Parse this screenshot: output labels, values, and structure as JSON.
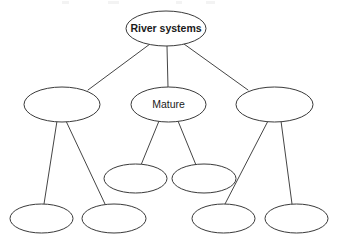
{
  "diagram": {
    "type": "concept-map-tree",
    "canvas": {
      "width": 337,
      "height": 247,
      "background": "#ffffff"
    },
    "style": {
      "node_fill": "#ffffff",
      "node_stroke": "#3a3a3a",
      "node_stroke_width": 1,
      "connector_stroke": "#454545",
      "connector_stroke_width": 1,
      "text_color": "#1a1a1a"
    },
    "nodes": [
      {
        "id": "root",
        "label": "River systems",
        "label_visible": true,
        "bold": true,
        "level": 0,
        "cx": 166,
        "cy": 28.5,
        "rx": 40,
        "ry": 17.5
      },
      {
        "id": "branch-left",
        "label": "",
        "label_visible": false,
        "bold": false,
        "level": 1,
        "cx": 62,
        "cy": 104.5,
        "rx": 38,
        "ry": 17.5
      },
      {
        "id": "branch-middle",
        "label": "Mature",
        "label_visible": true,
        "bold": false,
        "level": 1,
        "cx": 168.5,
        "cy": 104.5,
        "rx": 37.5,
        "ry": 17.5
      },
      {
        "id": "branch-right",
        "label": "",
        "label_visible": false,
        "bold": false,
        "level": 1,
        "cx": 274.5,
        "cy": 104.5,
        "rx": 38.5,
        "ry": 17.5
      },
      {
        "id": "leaf-mid-1",
        "label": "",
        "label_visible": false,
        "bold": false,
        "level": 2,
        "cx": 135.5,
        "cy": 178.5,
        "rx": 31.5,
        "ry": 14.5
      },
      {
        "id": "leaf-mid-2",
        "label": "",
        "label_visible": false,
        "bold": false,
        "level": 2,
        "cx": 204,
        "cy": 178.5,
        "rx": 32,
        "ry": 14.5
      },
      {
        "id": "leaf-bottom-1",
        "label": "",
        "label_visible": false,
        "bold": false,
        "level": 2,
        "cx": 41.5,
        "cy": 218.5,
        "rx": 31.5,
        "ry": 14.5
      },
      {
        "id": "leaf-bottom-2",
        "label": "",
        "label_visible": false,
        "bold": false,
        "level": 2,
        "cx": 114,
        "cy": 218.5,
        "rx": 32,
        "ry": 14.5
      },
      {
        "id": "leaf-bottom-3",
        "label": "",
        "label_visible": false,
        "bold": false,
        "level": 2,
        "cx": 223.5,
        "cy": 218.5,
        "rx": 31.5,
        "ry": 14.5
      },
      {
        "id": "leaf-bottom-4",
        "label": "",
        "label_visible": false,
        "bold": false,
        "level": 2,
        "cx": 296.5,
        "cy": 218.5,
        "rx": 31.5,
        "ry": 14.5
      }
    ],
    "edges": [
      {
        "id": "edge-root-left",
        "from": "root",
        "to": "branch-left",
        "x1": 150,
        "y1": 44,
        "x2": 88,
        "y2": 90
      },
      {
        "id": "edge-root-middle",
        "from": "root",
        "to": "branch-middle",
        "x1": 167,
        "y1": 46,
        "x2": 168,
        "y2": 87
      },
      {
        "id": "edge-root-right",
        "from": "root",
        "to": "branch-right",
        "x1": 184,
        "y1": 44,
        "x2": 248,
        "y2": 90
      },
      {
        "id": "edge-left-b1",
        "from": "branch-left",
        "to": "leaf-bottom-1",
        "x1": 57,
        "y1": 121,
        "x2": 44,
        "y2": 204
      },
      {
        "id": "edge-left-b2",
        "from": "branch-left",
        "to": "leaf-bottom-2",
        "x1": 66,
        "y1": 121,
        "x2": 105,
        "y2": 204
      },
      {
        "id": "edge-mid-m1",
        "from": "branch-middle",
        "to": "leaf-mid-1",
        "x1": 159,
        "y1": 121,
        "x2": 141,
        "y2": 165
      },
      {
        "id": "edge-mid-m2",
        "from": "branch-middle",
        "to": "leaf-mid-2",
        "x1": 178,
        "y1": 121,
        "x2": 196,
        "y2": 165
      },
      {
        "id": "edge-right-b3",
        "from": "branch-right",
        "to": "leaf-bottom-3",
        "x1": 268,
        "y1": 121,
        "x2": 225,
        "y2": 204
      },
      {
        "id": "edge-right-b4",
        "from": "branch-right",
        "to": "leaf-bottom-4",
        "x1": 281,
        "y1": 121,
        "x2": 292,
        "y2": 204
      }
    ],
    "artifacts": [
      {
        "id": "artifact-1",
        "left": 62,
        "width": 7
      },
      {
        "id": "artifact-2",
        "left": 108,
        "width": 11
      },
      {
        "id": "artifact-3",
        "left": 176,
        "width": 6
      },
      {
        "id": "artifact-4",
        "left": 206,
        "width": 9
      }
    ]
  }
}
